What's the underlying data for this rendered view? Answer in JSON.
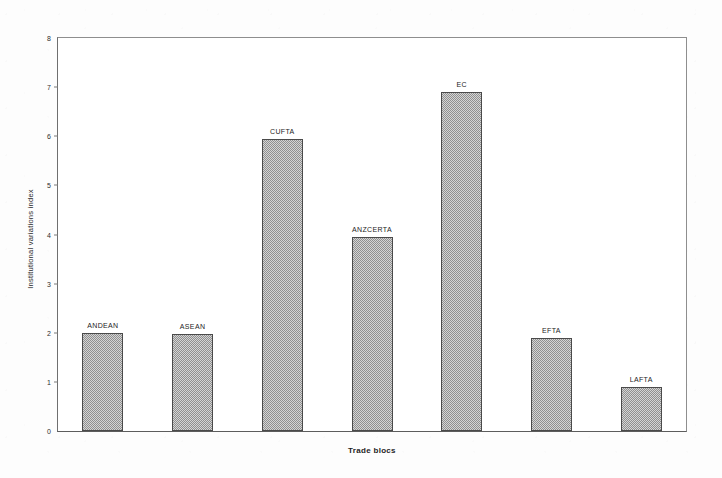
{
  "chart_data": {
    "type": "bar",
    "title": "",
    "xlabel": "Trade blocs",
    "ylabel": "Institutional variations index",
    "categories": [
      "ANDEAN",
      "ASEAN",
      "CUFTA",
      "ANZCERTA",
      "EC",
      "EFTA",
      "LAFTA"
    ],
    "values": [
      2.0,
      1.97,
      5.95,
      3.95,
      6.9,
      1.9,
      0.9
    ],
    "data_labels": [
      "ANDEAN",
      "ASEAN",
      "CUFTA",
      "ANZCERTA",
      "EC",
      "EFTA",
      "LAFTA"
    ],
    "ylim": [
      0,
      8
    ],
    "ytick_labels": [
      "0",
      "1",
      "2",
      "3",
      "4",
      "5",
      "6",
      "7",
      "8"
    ],
    "ytick_values": [
      0,
      1,
      2,
      3,
      4,
      5,
      6,
      7,
      8
    ],
    "grid": false,
    "legend": null,
    "legend_position": "none",
    "bar_fill_color": "#b9b9b9",
    "bar_edge_color": "#4a4a4a",
    "axis_color": "#7a7a7a",
    "background_color": "#ffffff",
    "annotations": []
  },
  "axes": {
    "y_title": "Institutional variations index",
    "x_title": "Trade blocs"
  }
}
